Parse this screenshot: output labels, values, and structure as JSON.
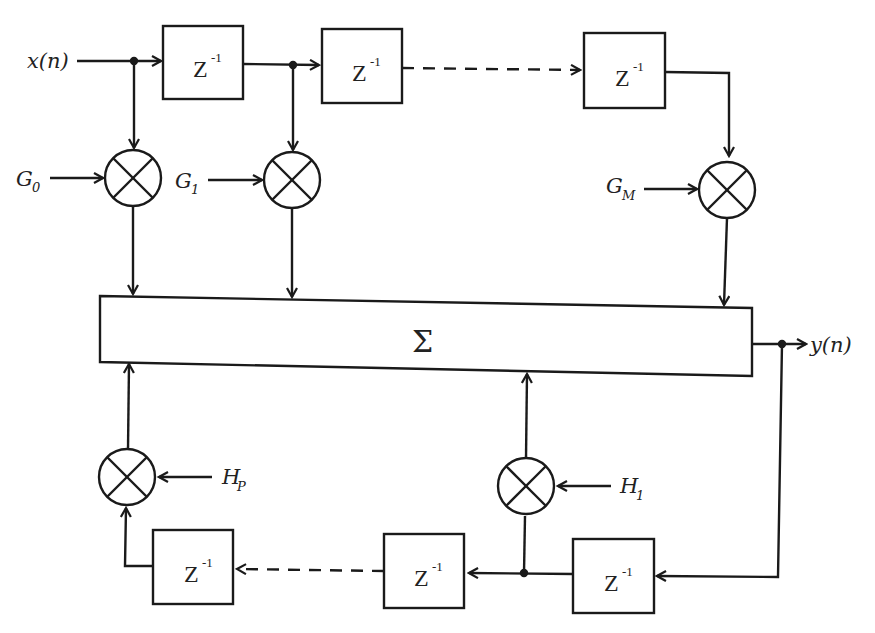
{
  "diagram": {
    "input_label": "x(n)",
    "output_label": "y(n)",
    "sum_label": "Σ",
    "delay_label": "Z",
    "delay_exponent": "-1",
    "feedforward_gains": [
      {
        "base": "G",
        "sub": "0"
      },
      {
        "base": "G",
        "sub": "1"
      },
      {
        "base": "G",
        "sub": "M"
      }
    ],
    "feedback_gains": [
      {
        "base": "H",
        "sub": "P"
      },
      {
        "base": "H",
        "sub": "1"
      }
    ],
    "colors": {
      "stroke": "#1a1a1a",
      "background": "#ffffff",
      "text": "#222222"
    }
  }
}
